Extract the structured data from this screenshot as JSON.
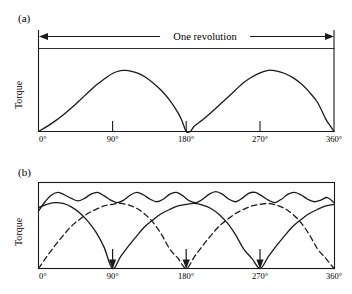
{
  "figure": {
    "background": "#ffffff",
    "line_color": "#1a1a1a",
    "panels": [
      {
        "id": "a",
        "label": "(a)",
        "ylabel": "Torque",
        "annotation": "One revolution"
      },
      {
        "id": "b",
        "label": "(b)",
        "ylabel": "Torque"
      }
    ]
  },
  "chart_data": [
    {
      "type": "line",
      "title": "(a)",
      "xlabel": "",
      "ylabel": "Torque",
      "xlim": [
        0,
        360
      ],
      "ylim": [
        0,
        1.18
      ],
      "grid": false,
      "legend": null,
      "xticks": [
        0,
        90,
        180,
        270,
        360
      ],
      "xtick_labels": [
        "0°",
        "90°",
        "180°",
        "270°",
        "360°"
      ],
      "yticks": [],
      "ytick_labels": [],
      "annotations": [
        {
          "text": "One revolution",
          "type": "double-arrow",
          "x_start": 0,
          "x_end": 360,
          "y": 1.12
        }
      ],
      "series": [
        {
          "name": "single-phase torque",
          "style": "solid",
          "comment": "Two identical humps, zero at 0, 180, 360 degrees; peak just past 90 and 270 degrees.",
          "x": [
            0,
            10,
            20,
            30,
            40,
            50,
            60,
            70,
            80,
            90,
            100,
            105,
            110,
            120,
            130,
            140,
            150,
            160,
            170,
            175,
            180,
            185,
            190,
            200,
            210,
            220,
            230,
            240,
            250,
            260,
            270,
            280,
            285,
            290,
            300,
            310,
            320,
            330,
            340,
            350,
            355,
            360
          ],
          "y": [
            0.0,
            0.07,
            0.15,
            0.24,
            0.34,
            0.45,
            0.56,
            0.67,
            0.76,
            0.84,
            0.88,
            0.885,
            0.88,
            0.85,
            0.79,
            0.7,
            0.59,
            0.45,
            0.27,
            0.15,
            0.0,
            0.0,
            0.08,
            0.17,
            0.27,
            0.38,
            0.49,
            0.6,
            0.71,
            0.79,
            0.85,
            0.885,
            0.885,
            0.875,
            0.84,
            0.78,
            0.69,
            0.57,
            0.42,
            0.18,
            0.09,
            0.0
          ]
        }
      ]
    },
    {
      "type": "line",
      "title": "(b)",
      "xlabel": "",
      "ylabel": "Torque",
      "xlim": [
        0,
        360
      ],
      "ylim": [
        0,
        1.0
      ],
      "grid": false,
      "legend": null,
      "xticks": [
        0,
        90,
        180,
        270,
        360
      ],
      "xtick_labels": [
        "0°",
        "90°",
        "180°",
        "270°",
        "360°"
      ],
      "yticks": [],
      "ytick_labels": [],
      "annotations": [
        {
          "text": "",
          "type": "down-arrow",
          "x": 90,
          "y_top": 0.22,
          "y_bottom": 0.0
        },
        {
          "text": "",
          "type": "down-arrow",
          "x": 180,
          "y_top": 0.22,
          "y_bottom": 0.0
        },
        {
          "text": "",
          "type": "down-arrow",
          "x": 270,
          "y_top": 0.22,
          "y_bottom": 0.0
        }
      ],
      "series": [
        {
          "name": "resultant rippled torque",
          "style": "solid",
          "comment": "Upper wavy curve: sum of phase torques, small ripple with about 45 degree period.",
          "x": [
            0,
            8,
            16,
            24,
            32,
            40,
            48,
            56,
            64,
            72,
            80,
            88,
            96,
            104,
            112,
            120,
            128,
            136,
            144,
            152,
            160,
            168,
            176,
            184,
            192,
            200,
            208,
            216,
            224,
            232,
            240,
            248,
            256,
            264,
            272,
            280,
            288,
            296,
            304,
            312,
            320,
            328,
            336,
            344,
            352,
            360
          ],
          "y": [
            0.68,
            0.79,
            0.87,
            0.9,
            0.87,
            0.83,
            0.8,
            0.83,
            0.88,
            0.9,
            0.86,
            0.81,
            0.78,
            0.81,
            0.87,
            0.9,
            0.87,
            0.82,
            0.79,
            0.82,
            0.88,
            0.9,
            0.86,
            0.8,
            0.78,
            0.82,
            0.88,
            0.91,
            0.88,
            0.82,
            0.79,
            0.83,
            0.89,
            0.9,
            0.86,
            0.81,
            0.78,
            0.82,
            0.88,
            0.9,
            0.87,
            0.82,
            0.79,
            0.81,
            0.84,
            0.78
          ]
        },
        {
          "name": "phase A torque",
          "style": "solid",
          "comment": "Rises from 0.72 at 0 degrees, peaks near 30 degrees, falls to zero at 90, 270; triangular wave of 180 degree period.",
          "x": [
            0,
            10,
            20,
            30,
            40,
            50,
            60,
            70,
            80,
            90,
            100,
            110,
            120,
            130,
            140,
            150,
            160,
            170,
            180,
            190,
            200,
            210,
            220,
            230,
            240,
            250,
            260,
            270,
            280,
            290,
            300,
            310,
            320,
            330,
            340,
            350,
            360
          ],
          "y": [
            0.72,
            0.76,
            0.78,
            0.77,
            0.73,
            0.66,
            0.56,
            0.43,
            0.25,
            0.0,
            0.14,
            0.27,
            0.39,
            0.5,
            0.58,
            0.65,
            0.7,
            0.74,
            0.76,
            0.77,
            0.75,
            0.71,
            0.64,
            0.54,
            0.4,
            0.23,
            0.12,
            0.0,
            0.14,
            0.27,
            0.39,
            0.5,
            0.58,
            0.65,
            0.7,
            0.74,
            0.76
          ]
        },
        {
          "name": "phase B torque",
          "style": "dashed",
          "comment": "Same shape as phase A but shifted 90 degrees; zero at 0, 180, 360 degrees.",
          "x": [
            0,
            10,
            20,
            30,
            40,
            50,
            60,
            70,
            80,
            90,
            100,
            110,
            120,
            130,
            140,
            150,
            160,
            170,
            180,
            190,
            200,
            210,
            220,
            230,
            240,
            250,
            260,
            270,
            280,
            290,
            300,
            310,
            320,
            330,
            340,
            350,
            360
          ],
          "y": [
            0.0,
            0.14,
            0.27,
            0.39,
            0.5,
            0.58,
            0.65,
            0.7,
            0.74,
            0.76,
            0.77,
            0.75,
            0.71,
            0.64,
            0.54,
            0.4,
            0.23,
            0.12,
            0.0,
            0.14,
            0.27,
            0.39,
            0.5,
            0.58,
            0.65,
            0.7,
            0.74,
            0.76,
            0.77,
            0.75,
            0.71,
            0.64,
            0.54,
            0.4,
            0.23,
            0.12,
            0.0
          ]
        }
      ]
    }
  ]
}
